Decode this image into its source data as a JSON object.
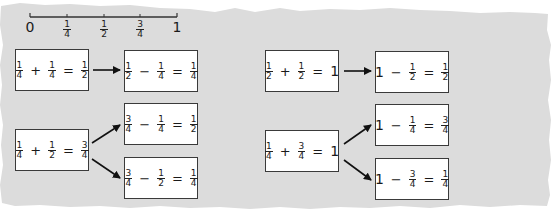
{
  "number_line": {
    "start_label": "0",
    "end_label": "1",
    "ticks": [
      {
        "num": "1",
        "den": "4"
      },
      {
        "num": "1",
        "den": "2"
      },
      {
        "num": "3",
        "den": "4"
      }
    ]
  },
  "left_panel": {
    "groups": [
      {
        "source": {
          "a": {
            "num": "1",
            "den": "4"
          },
          "op": "+",
          "b": {
            "num": "1",
            "den": "4"
          },
          "eq": "=",
          "c": {
            "num": "1",
            "den": "2"
          }
        },
        "targets": [
          {
            "a": {
              "num": "1",
              "den": "2"
            },
            "op": "−",
            "b": {
              "num": "1",
              "den": "4"
            },
            "eq": "=",
            "c": {
              "num": "1",
              "den": "4"
            }
          }
        ]
      },
      {
        "source": {
          "a": {
            "num": "1",
            "den": "4"
          },
          "op": "+",
          "b": {
            "num": "1",
            "den": "2"
          },
          "eq": "=",
          "c": {
            "num": "3",
            "den": "4"
          }
        },
        "targets": [
          {
            "a": {
              "num": "3",
              "den": "4"
            },
            "op": "−",
            "b": {
              "num": "1",
              "den": "4"
            },
            "eq": "=",
            "c": {
              "num": "1",
              "den": "2"
            }
          },
          {
            "a": {
              "num": "3",
              "den": "4"
            },
            "op": "−",
            "b": {
              "num": "1",
              "den": "2"
            },
            "eq": "=",
            "c": {
              "num": "1",
              "den": "4"
            }
          }
        ]
      }
    ]
  },
  "right_panel": {
    "groups": [
      {
        "source": {
          "a": {
            "num": "1",
            "den": "2"
          },
          "op": "+",
          "b": {
            "num": "1",
            "den": "2"
          },
          "eq": "=",
          "c": "1"
        },
        "targets": [
          {
            "a": "1",
            "op": "−",
            "b": {
              "num": "1",
              "den": "2"
            },
            "eq": "=",
            "c": {
              "num": "1",
              "den": "2"
            }
          }
        ]
      },
      {
        "source": {
          "a": {
            "num": "1",
            "den": "4"
          },
          "op": "+",
          "b": {
            "num": "3",
            "den": "4"
          },
          "eq": "=",
          "c": "1"
        },
        "targets": [
          {
            "a": "1",
            "op": "−",
            "b": {
              "num": "1",
              "den": "4"
            },
            "eq": "=",
            "c": {
              "num": "3",
              "den": "4"
            }
          },
          {
            "a": "1",
            "op": "−",
            "b": {
              "num": "3",
              "den": "4"
            },
            "eq": "=",
            "c": {
              "num": "1",
              "den": "4"
            }
          }
        ]
      }
    ]
  },
  "colors": {
    "background_paper": "#dcdcdc",
    "box_fill": "#ffffff",
    "box_border": "#3a3a3a",
    "ink": "#1a1a1a"
  }
}
